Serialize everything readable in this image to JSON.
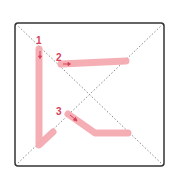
{
  "diagram": {
    "type": "stroke-order",
    "colors": {
      "frame": "#333333",
      "guide": "#888888",
      "stroke": "#f4a6ac",
      "number": "#d9405a",
      "arrow": "#d9405a"
    },
    "strokes": [
      {
        "number": "1",
        "direction": "down"
      },
      {
        "number": "2",
        "direction": "right"
      },
      {
        "number": "3",
        "direction": "down-right"
      }
    ]
  }
}
